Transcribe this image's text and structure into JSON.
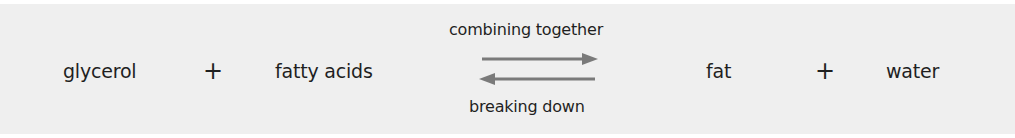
{
  "equation": {
    "reactant_1": "glycerol",
    "operator_1": "+",
    "reactant_2": "fatty acids",
    "product_1": "fat",
    "operator_2": "+",
    "product_2": "water"
  },
  "reaction_arrows": {
    "forward_label": "combining together",
    "reverse_label": "breaking down",
    "forward_icon": "right-arrow-icon",
    "reverse_icon": "left-arrow-icon",
    "arrow_color": "#7a7a7a"
  },
  "colors": {
    "panel_background": "#efefef",
    "text": "#1f1f1f"
  }
}
